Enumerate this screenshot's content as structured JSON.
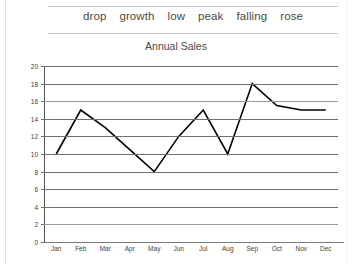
{
  "word_bank": {
    "words": [
      "drop",
      "growth",
      "low",
      "peak",
      "falling",
      "rose"
    ]
  },
  "chart_data": {
    "type": "line",
    "title": "Annual Sales",
    "xlabel": "",
    "ylabel": "",
    "categories": [
      "Jan",
      "Feb",
      "Mar",
      "Apr",
      "May",
      "Jun",
      "Jul",
      "Aug",
      "Sep",
      "Oct",
      "Nov",
      "Dec"
    ],
    "values": [
      10,
      15,
      13,
      10.5,
      8,
      12,
      15,
      10,
      18,
      15.5,
      15,
      15
    ],
    "series": [
      {
        "name": "Annual Sales",
        "values": [
          10,
          15,
          13,
          10.5,
          8,
          12,
          15,
          10,
          18,
          15.5,
          15,
          15
        ]
      }
    ],
    "ylim": [
      0,
      20
    ],
    "yticks": [
      0,
      2,
      4,
      6,
      8,
      10,
      12,
      14,
      16,
      18,
      20
    ],
    "ytick_labels": [
      "0",
      "2",
      "4",
      "6",
      "8",
      "10",
      "12",
      "14",
      "16",
      "18",
      "20"
    ],
    "grid": true,
    "legend": false,
    "line_color": "#000000"
  }
}
